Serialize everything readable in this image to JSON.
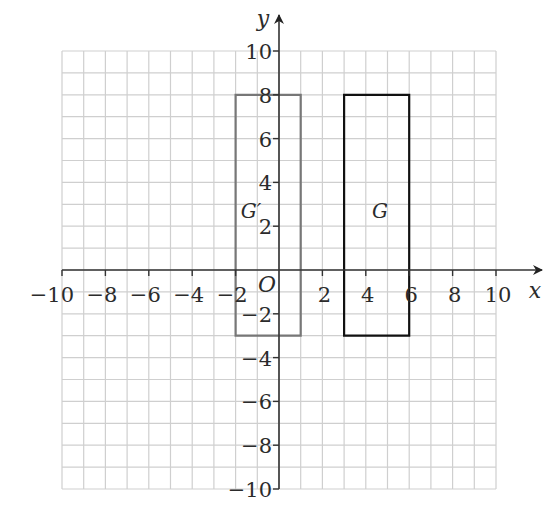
{
  "diagram": {
    "type": "coordinate-grid",
    "x_axis": {
      "label": "x",
      "min": -10,
      "max": 10,
      "tick_step": 2,
      "tick_labels": [
        "−10",
        "−8",
        "−6",
        "−4",
        "−2",
        "2",
        "4",
        "6",
        "8",
        "10"
      ]
    },
    "y_axis": {
      "label": "y",
      "min": -10,
      "max": 10,
      "tick_step": 2,
      "tick_labels": [
        "10",
        "8",
        "6",
        "4",
        "2",
        "−2",
        "−4",
        "−6",
        "−8",
        "−10"
      ]
    },
    "origin_label": "O",
    "grid_step": 1,
    "shapes": [
      {
        "name": "G",
        "label": "G",
        "kind": "rectangle",
        "vertices": [
          [
            3,
            8
          ],
          [
            6,
            8
          ],
          [
            6,
            -3
          ],
          [
            3,
            -3
          ]
        ],
        "stroke": "#111111"
      },
      {
        "name": "G-prime",
        "label": "G′",
        "kind": "rectangle",
        "vertices": [
          [
            -2,
            8
          ],
          [
            1,
            8
          ],
          [
            1,
            -3
          ],
          [
            -2,
            -3
          ]
        ],
        "stroke": "#777777"
      }
    ],
    "colors": {
      "grid": "#cfcfcf",
      "axes": "#333333",
      "text": "#2b2b2b"
    }
  }
}
